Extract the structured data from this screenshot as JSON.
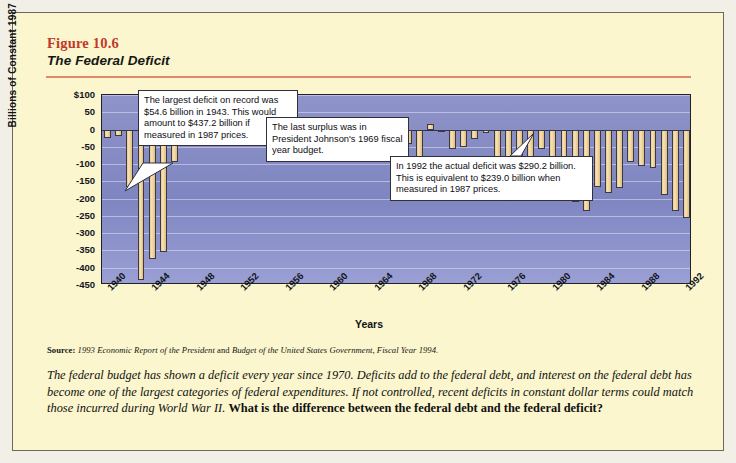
{
  "figure": {
    "number": "Figure 10.6",
    "title": "The Federal Deficit",
    "accent_color": "#c0392b",
    "rule_color": "#e08a6a",
    "card_background": "#fbf6cd",
    "plot_background": "#8e93c8",
    "bar_color": "#edcd92"
  },
  "callouts": [
    {
      "id": "largest-deficit",
      "text": "The largest deficit on record was $54.6 billion in 1943. This would amount to $437.2 billion if measured in 1987 prices."
    },
    {
      "id": "last-surplus",
      "text": "The last surplus was in President Johnson's 1969 fiscal year budget."
    },
    {
      "id": "deficit-1992",
      "text": "In 1992 the actual deficit was $290.2 billion. This is equivalent to $239.0 billion when measured in 1987 prices."
    }
  ],
  "source": {
    "label": "Source:",
    "part1": "1993 Economic Report of the President",
    "conj": "and",
    "part2": "Budget of the United States Government, Fiscal Year 1994."
  },
  "body": {
    "italic": "The federal budget has shown a deficit every year since 1970. Deficits add to the federal debt, and interest on the federal debt has become one of the largest categories of federal expenditures. If not controlled, recent deficits in constant dollar terms could match those incurred during World War II.",
    "question": "What is the difference between the federal debt and the federal deficit?"
  },
  "chart_data": {
    "type": "bar",
    "title": "The Federal Deficit",
    "xlabel": "Years",
    "ylabel": "Billions of Constant 1987 Dollars",
    "ylim": [
      -450,
      100
    ],
    "ytick_labels": [
      "$100",
      "50",
      "0",
      "-50",
      "-100",
      "-150",
      "-200",
      "-250",
      "-300",
      "-350",
      "-400",
      "-450"
    ],
    "ytick_values": [
      100,
      50,
      0,
      -50,
      -100,
      -150,
      -200,
      -250,
      -300,
      -350,
      -400,
      -450
    ],
    "xtick_labels": [
      "1940",
      "1944",
      "1948",
      "1952",
      "1956",
      "1960",
      "1964",
      "1968",
      "1972",
      "1976",
      "1980",
      "1984",
      "1988",
      "1992"
    ],
    "grid": true,
    "legend": "none",
    "categories": [
      "1940",
      "1941",
      "1942",
      "1943",
      "1944",
      "1945",
      "1946",
      "1947",
      "1948",
      "1949",
      "1950",
      "1951",
      "1952",
      "1953",
      "1954",
      "1955",
      "1956",
      "1957",
      "1958",
      "1959",
      "1960",
      "1961",
      "1962",
      "1963",
      "1964",
      "1965",
      "1966",
      "1967",
      "1968",
      "1969",
      "1970",
      "1971",
      "1972",
      "1973",
      "1974",
      "1975",
      "1976",
      "1977",
      "1978",
      "1979",
      "1980",
      "1981",
      "1982",
      "1983",
      "1984",
      "1985",
      "1986",
      "1987",
      "1988",
      "1989",
      "1990",
      "1991",
      "1992"
    ],
    "values": [
      -25,
      -20,
      -165,
      -437,
      -375,
      -355,
      -95,
      28,
      60,
      3,
      -22,
      40,
      -8,
      -35,
      -10,
      -30,
      25,
      22,
      -15,
      -58,
      3,
      -12,
      -28,
      -22,
      -25,
      -12,
      -18,
      -42,
      -82,
      15,
      -8,
      -55,
      -50,
      -28,
      -10,
      -105,
      -140,
      -95,
      -95,
      -55,
      -110,
      -100,
      -210,
      -235,
      -165,
      -185,
      -170,
      -95,
      -105,
      -110,
      -190,
      -235,
      -255
    ]
  }
}
